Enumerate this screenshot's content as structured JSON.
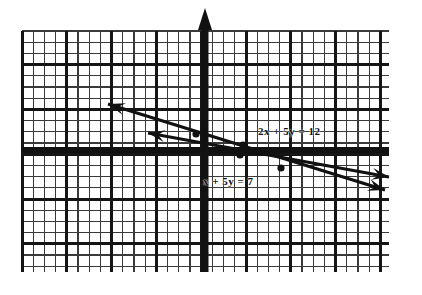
{
  "figure": {
    "kind": "hand-drawn-graph-paper-plot",
    "title": "",
    "background_color": "#ffffff",
    "ink_color": "#111111"
  },
  "grid": {
    "left": 22,
    "top": 31,
    "right": 389,
    "bottom": 272,
    "minor_spacing_px": 11.2,
    "major_every": 4,
    "minor_color": "#2b2b2b",
    "major_color": "#111111",
    "minor_width": 1.3,
    "major_width": 3.0
  },
  "axes": {
    "y_axis": {
      "x_px": 205,
      "top_px": 8,
      "bottom_px": 272,
      "width": 7,
      "arrow": "up"
    },
    "x_axis": {
      "y_px": 150,
      "left_px": 22,
      "right_px": 389,
      "width": 6,
      "arrow": "none"
    },
    "color": "#111111"
  },
  "chart_data": {
    "type": "line",
    "title": "",
    "xlabel": "x",
    "ylabel": "y",
    "grid": true,
    "legend": "inline-annotations",
    "xlim": [
      -8.2,
      8.2
    ],
    "ylim": [
      -5.4,
      5.3
    ],
    "series": [
      {
        "name": "2x + 5y = 12",
        "label": "2x + 5y = 12",
        "equation": "2x + 5y = 12",
        "slope": -0.4,
        "y_intercept": 2.4,
        "x_intercept": 6.0,
        "points": [
          [
            -8,
            5.6
          ],
          [
            0,
            2.4
          ],
          [
            6,
            0
          ],
          [
            8,
            -0.8
          ]
        ],
        "pixels": {
          "x1": 108,
          "y1": 104,
          "x2": 385,
          "y2": 190
        },
        "arrows": [
          "start",
          "end"
        ],
        "label_position_px": [
          258,
          126
        ]
      },
      {
        "name": "x + 5y = 7",
        "label": "x + 5y = 7",
        "equation": "x + 5y = 7",
        "slope": -0.2,
        "y_intercept": 1.4,
        "x_intercept": 7.0,
        "points": [
          [
            -8,
            3.0
          ],
          [
            0,
            1.4
          ],
          [
            7,
            0
          ],
          [
            8,
            -0.2
          ]
        ],
        "pixels": {
          "x1": 148,
          "y1": 133,
          "x2": 389,
          "y2": 177
        },
        "arrows": [
          "start",
          "end"
        ],
        "label_position_px": [
          203,
          176
        ]
      }
    ],
    "intersection": {
      "x": -1.67,
      "y": 2.67,
      "pixel": [
        196,
        134
      ]
    },
    "marked_points_px": [
      [
        196,
        134
      ],
      [
        243,
        145
      ],
      [
        240,
        155
      ],
      [
        281,
        168
      ]
    ],
    "annotations": [
      {
        "text": "2x + 5y = 12",
        "x_px": 258,
        "y_px": 126
      },
      {
        "text": "x + 5y = 7",
        "x_px": 203,
        "y_px": 176
      }
    ]
  },
  "labels": {
    "line_top": "2x + 5y = 12",
    "line_bottom": "x + 5y = 7"
  }
}
